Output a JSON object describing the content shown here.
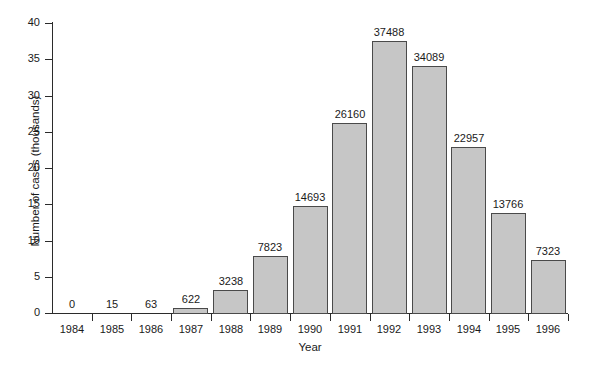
{
  "chart_data": {
    "type": "bar",
    "title": "",
    "xlabel": "Year",
    "ylabel": "Number of cases (thousands)",
    "categories": [
      "1984",
      "1985",
      "1986",
      "1987",
      "1988",
      "1989",
      "1990",
      "1991",
      "1992",
      "1993",
      "1994",
      "1995",
      "1996"
    ],
    "values": [
      0,
      15,
      63,
      622,
      3238,
      7823,
      14693,
      26160,
      37488,
      34089,
      22957,
      13766,
      7323
    ],
    "value_labels": [
      "0",
      "15",
      "63",
      "622",
      "3238",
      "7823",
      "14693",
      "26160",
      "37488",
      "34089",
      "22957",
      "13766",
      "7323"
    ],
    "ylim": [
      0,
      40000
    ],
    "y_ticks": [
      0,
      5,
      10,
      15,
      20,
      25,
      30,
      35,
      40
    ],
    "y_tick_labels": [
      "0",
      "5",
      "10",
      "15",
      "20",
      "25",
      "30",
      "35",
      "40"
    ],
    "y_unit_scale": 1000,
    "grid": false,
    "legend": null,
    "bar_color": "#c6c6c6",
    "bar_edge_color": "#4a4a4a",
    "axis_color": "#2b2b2b"
  }
}
